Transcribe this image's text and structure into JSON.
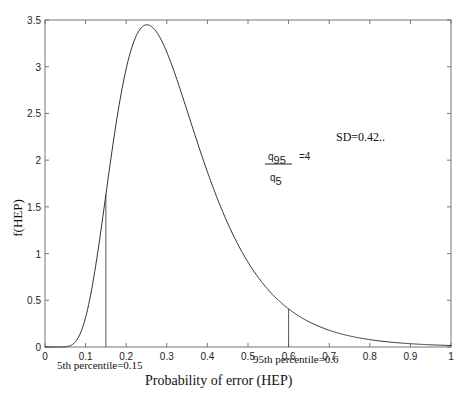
{
  "chart_data": {
    "type": "line",
    "title": "",
    "xlabel": "Probability of error (HEP)",
    "ylabel": "f(HEP)",
    "xlim": [
      0,
      1
    ],
    "ylim": [
      0,
      3.5
    ],
    "grid": false,
    "legend": null,
    "x_ticks": [
      "0",
      "0.1",
      "0.2",
      "0.3",
      "0.4",
      "0.5",
      "0.6",
      "0.7",
      "0.8",
      "0.9",
      "1"
    ],
    "y_ticks": [
      "0",
      "0.5",
      "1",
      "1.5",
      "2",
      "2.5",
      "3",
      "3.5"
    ],
    "series": [
      {
        "name": "lognormal HEP density",
        "x": [
          0.0,
          0.03,
          0.05,
          0.075,
          0.1,
          0.125,
          0.15,
          0.175,
          0.2,
          0.225,
          0.25,
          0.275,
          0.3,
          0.35,
          0.4,
          0.45,
          0.5,
          0.55,
          0.6,
          0.65,
          0.7,
          0.8,
          0.9,
          1.0
        ],
        "y": [
          0.0,
          0.0,
          0.002,
          0.05,
          0.316,
          0.9,
          1.63,
          2.37,
          2.98,
          3.33,
          3.45,
          3.38,
          3.16,
          2.53,
          1.875,
          1.324,
          0.908,
          0.61,
          0.408,
          0.27,
          0.179,
          0.079,
          0.035,
          0.016
        ]
      }
    ],
    "vertical_markers": [
      {
        "x": 0.15,
        "y_top": 1.63,
        "label": "5th percentile=0.15"
      },
      {
        "x": 0.6,
        "y_top": 0.408,
        "label": "95th percentile=0.6"
      }
    ],
    "annotations": [
      {
        "text_num": "q95",
        "text_den": "q5",
        "text_eq": "=4",
        "x": 0.56,
        "y": 2.1
      },
      {
        "text": "SD=0.42..",
        "x": 0.73,
        "y": 2.3
      }
    ]
  }
}
